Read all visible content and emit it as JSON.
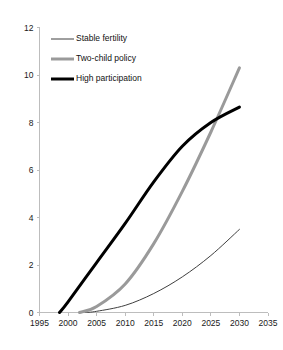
{
  "chart_data": {
    "type": "line",
    "title": "",
    "subtitle": "",
    "xlabel": "",
    "ylabel": "",
    "xlim": [
      1995,
      2035
    ],
    "ylim": [
      0,
      12
    ],
    "xticks": [
      1995,
      2000,
      2005,
      2010,
      2015,
      2020,
      2025,
      2030,
      2035
    ],
    "xtick_labels": [
      "1995",
      "2000",
      "2005",
      "2010",
      "2015",
      "2020",
      "2025",
      "2030",
      "2035"
    ],
    "yticks": [
      0,
      2,
      4,
      6,
      8,
      10,
      12
    ],
    "ytick_labels": [
      "0",
      "2",
      "4",
      "6",
      "8",
      "10",
      "12"
    ],
    "grid": false,
    "legend_position": "upper-left",
    "series": [
      {
        "name": "Stable fertility",
        "color": "#3f3f3f",
        "line_width": 1,
        "x": [
          2003,
          2005,
          2010,
          2015,
          2020,
          2025,
          2030
        ],
        "values": [
          0.0,
          0.05,
          0.3,
          0.8,
          1.5,
          2.4,
          3.5
        ]
      },
      {
        "name": "Two-child policy",
        "color": "#9a9a9a",
        "line_width": 3,
        "x": [
          2002,
          2005,
          2010,
          2015,
          2020,
          2025,
          2030
        ],
        "values": [
          0.0,
          0.25,
          1.2,
          2.9,
          5.1,
          7.6,
          10.3
        ]
      },
      {
        "name": "High participation",
        "color": "#000000",
        "line_width": 3,
        "x": [
          1998.5,
          2000,
          2005,
          2010,
          2015,
          2020,
          2025,
          2030
        ],
        "values": [
          0.0,
          0.45,
          2.1,
          3.75,
          5.5,
          7.0,
          8.0,
          8.65
        ]
      }
    ],
    "legend": [
      {
        "label": "Stable fertility",
        "color": "#3f3f3f",
        "line_width": 1
      },
      {
        "label": "Two-child policy",
        "color": "#9a9a9a",
        "line_width": 3
      },
      {
        "label": "High participation",
        "color": "#000000",
        "line_width": 3
      }
    ],
    "axis_color": "#bdbdbd"
  }
}
